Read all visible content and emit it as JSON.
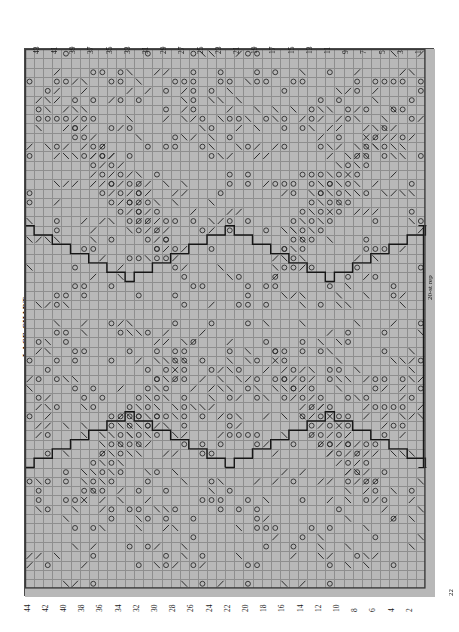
{
  "page": {
    "title": "LACE CHART",
    "background": "#ffffff",
    "chart_fill": "#b8b8b8",
    "grid_line_color": "#8e8e8e",
    "symbol_color": "#2b2b2b",
    "outline_color": "#161616"
  },
  "chart": {
    "columns": 44,
    "rows": 58,
    "cell_width": 9.1,
    "cell_height": 9.3,
    "origin_x": 24,
    "origin_y": 48,
    "top_numbers": [
      "43",
      "41",
      "39",
      "37",
      "35",
      "33",
      "31",
      "29",
      "27",
      "25",
      "23",
      "21",
      "19",
      "17",
      "15",
      "13",
      "11",
      "9",
      "7",
      "5",
      "3",
      "1"
    ],
    "bottom_numbers": [
      "44",
      "42",
      "40",
      "38",
      "36",
      "34",
      "32",
      "30",
      "28",
      "26",
      "24",
      "22",
      "20",
      "18",
      "16",
      "14",
      "12",
      "10",
      "8",
      "6",
      "4",
      "2"
    ],
    "repeat_label": "20-st rep",
    "corner_label": "22"
  },
  "legend": {
    "symbols": [
      {
        "name": "yarn-over",
        "glyph": "O",
        "meaning": "yarn over"
      },
      {
        "name": "ssk-left-lean",
        "glyph": "\\",
        "meaning": "left-leaning decrease"
      },
      {
        "name": "k2tog-right-lean",
        "glyph": "/",
        "meaning": "right-leaning decrease"
      },
      {
        "name": "knit",
        "glyph": "",
        "meaning": "knit / blank"
      }
    ]
  },
  "symbol_map": {
    "note": "Each entry is [row, col, symbol] with row 0 = top row of chart and col 0 = left-most column.",
    "cells": []
  }
}
